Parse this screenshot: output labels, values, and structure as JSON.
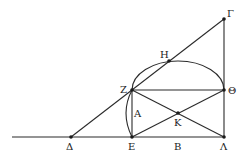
{
  "diagram": {
    "type": "geometric-construction",
    "points": [
      {
        "id": "Gamma",
        "label": "Γ",
        "x": 224,
        "y": 19,
        "lx": 227,
        "ly": 17
      },
      {
        "id": "Eta",
        "label": "Η",
        "x": 169,
        "y": 61,
        "lx": 160,
        "ly": 58
      },
      {
        "id": "Zeta",
        "label": "Ζ",
        "x": 132,
        "y": 90,
        "lx": 120,
        "ly": 93
      },
      {
        "id": "Theta",
        "label": "Θ",
        "x": 224,
        "y": 90,
        "lx": 228,
        "ly": 94
      },
      {
        "id": "Alpha",
        "label": "Α",
        "x": 132,
        "y": 113,
        "lx": 134,
        "ly": 117
      },
      {
        "id": "Kappa",
        "label": "Κ",
        "x": 178,
        "y": 113,
        "lx": 174,
        "ly": 126
      },
      {
        "id": "Delta",
        "label": "Δ",
        "x": 71,
        "y": 137,
        "lx": 66,
        "ly": 150
      },
      {
        "id": "Epsilon",
        "label": "Ε",
        "x": 132,
        "y": 137,
        "lx": 128,
        "ly": 150
      },
      {
        "id": "Beta",
        "label": "Β",
        "x": 178,
        "y": 137,
        "lx": 174,
        "ly": 150
      },
      {
        "id": "Lambda",
        "label": "Λ",
        "x": 224,
        "y": 137,
        "lx": 220,
        "ly": 150
      }
    ],
    "segments": [
      [
        "baseline-start",
        "Lambda"
      ],
      [
        "Delta",
        "Gamma"
      ],
      [
        "Gamma",
        "Lambda"
      ],
      [
        "Zeta",
        "Theta"
      ],
      [
        "Zeta",
        "Epsilon"
      ],
      [
        "Zeta",
        "Lambda"
      ],
      [
        "Epsilon",
        "Theta"
      ]
    ],
    "arcs": [
      "semicircle over Z–Θ through H",
      "arc Z–E bulging left"
    ]
  }
}
